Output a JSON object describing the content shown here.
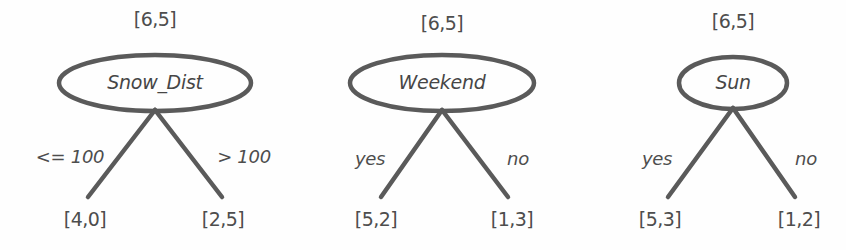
{
  "figure": {
    "type": "decision-tree-stumps",
    "background_color": "#fefefe",
    "stroke_color": "#5a5a5a",
    "text_color": "#4d4d4d"
  },
  "trees": [
    {
      "id": "tree-snow-dist",
      "root_count": "[6,5]",
      "root_label": "Snow_Dist",
      "left_edge_label": "<= 100",
      "right_edge_label": "> 100",
      "left_leaf_count": "[4,0]",
      "right_leaf_count": "[2,5]",
      "geometry": {
        "offset_x": 0,
        "center_x": 155,
        "ellipse_rx": 96,
        "ellipse_ry": 28,
        "ellipse_cy": 83,
        "count_y": 10,
        "edge_label_y": 148,
        "leaf_y": 210,
        "left_leaf_x": 85,
        "right_leaf_x": 223,
        "left_edge_label_x": 70,
        "right_edge_label_x": 244,
        "branch_bottom_y": 197,
        "branch_left_x": 88,
        "branch_right_x": 222
      }
    },
    {
      "id": "tree-weekend",
      "root_count": "[6,5]",
      "root_label": "Weekend",
      "left_edge_label": "yes",
      "right_edge_label": "no",
      "left_leaf_count": "[5,2]",
      "right_leaf_count": "[1,3]",
      "geometry": {
        "offset_x": 0,
        "center_x": 442,
        "ellipse_rx": 92,
        "ellipse_ry": 28,
        "ellipse_cy": 83,
        "count_y": 14,
        "edge_label_y": 150,
        "leaf_y": 210,
        "left_leaf_x": 376,
        "right_leaf_x": 512,
        "left_edge_label_x": 370,
        "right_edge_label_x": 518,
        "branch_bottom_y": 197,
        "branch_left_x": 381,
        "branch_right_x": 508
      }
    },
    {
      "id": "tree-sun",
      "root_count": "[6,5]",
      "root_label": "Sun",
      "left_edge_label": "yes",
      "right_edge_label": "no",
      "left_leaf_count": "[5,3]",
      "right_leaf_count": "[1,2]",
      "geometry": {
        "offset_x": 0,
        "center_x": 733,
        "ellipse_rx": 54,
        "ellipse_ry": 26,
        "ellipse_cy": 83,
        "count_y": 12,
        "edge_label_y": 150,
        "leaf_y": 210,
        "left_leaf_x": 660,
        "right_leaf_x": 799,
        "left_edge_label_x": 657,
        "right_edge_label_x": 806,
        "branch_bottom_y": 197,
        "branch_left_x": 668,
        "branch_right_x": 795
      }
    }
  ]
}
